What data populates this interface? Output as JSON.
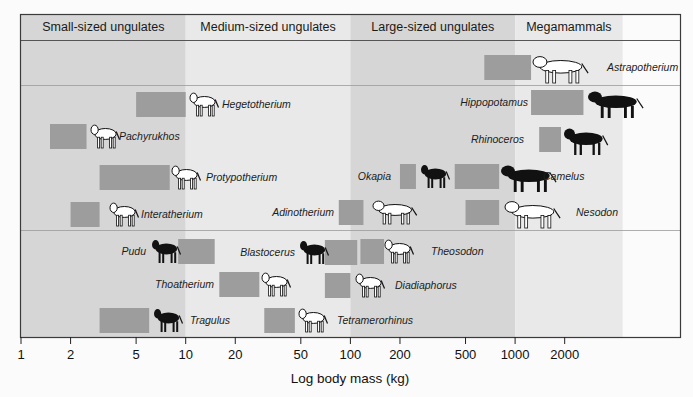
{
  "chart_data": {
    "type": "range",
    "title": "",
    "xlabel": "Log body mass (kg)",
    "ylabel": "",
    "x_scale": "log10",
    "xlim": [
      1,
      4500
    ],
    "x_ticks": [
      1,
      2,
      5,
      10,
      20,
      50,
      100,
      200,
      500,
      1000,
      2000
    ],
    "x_tick_labels": [
      "1",
      "2",
      "5",
      "10",
      "20",
      "50",
      "100",
      "200",
      "500",
      "1000",
      "2000"
    ],
    "grid": false,
    "legend": null,
    "size_classes": [
      {
        "name": "Small-sized ungulates",
        "range_kg": [
          1,
          10
        ],
        "shade": "#d6d6d6"
      },
      {
        "name": "Medium-sized ungulates",
        "range_kg": [
          10,
          100
        ],
        "shade": "#e9e9e9"
      },
      {
        "name": "Large-sized ungulates",
        "range_kg": [
          100,
          1000
        ],
        "shade": "#d6d6d6"
      },
      {
        "name": "Megamammals",
        "range_kg": [
          1000,
          4500
        ],
        "shade": "#e9e9e9"
      }
    ],
    "row_groups": [
      {
        "name": "megamammal-row",
        "y_top": 40,
        "y_bottom": 85
      },
      {
        "name": "native-and-extant-row",
        "y_top": 85,
        "y_bottom": 230
      },
      {
        "name": "ungulate-comparison-row",
        "y_top": 230,
        "y_bottom": 337
      }
    ],
    "taxa": [
      {
        "name": "Astrapotherium",
        "min_kg": 650,
        "max_kg": 1250,
        "y": 55,
        "silhouette": "outline",
        "label_side": "right",
        "icon_x": 533,
        "label_x": 607
      },
      {
        "name": "Hegetotherium",
        "min_kg": 5,
        "max_kg": 10,
        "y": 92,
        "silhouette": "outline",
        "label_side": "right",
        "icon_x": 190,
        "label_x": 222
      },
      {
        "name": "Hippopotamus",
        "min_kg": 1250,
        "max_kg": 2600,
        "y": 90,
        "silhouette": "filled",
        "label_side": "left",
        "icon_x": 588,
        "label_x": 528
      },
      {
        "name": "Pachyrukhos",
        "min_kg": 1.5,
        "max_kg": 2.5,
        "y": 124,
        "silhouette": "outline",
        "label_side": "right",
        "icon_x": 91,
        "label_x": 119
      },
      {
        "name": "Rhinoceros",
        "min_kg": 1400,
        "max_kg": 1900,
        "y": 127,
        "silhouette": "filled",
        "label_side": "left",
        "icon_x": 564,
        "label_x": 524
      },
      {
        "name": "Okapia",
        "min_kg": 200,
        "max_kg": 250,
        "y": 164,
        "silhouette": "filled",
        "label_side": "left",
        "icon_x": 421,
        "label_x": 391
      },
      {
        "name": "Camelus",
        "min_kg": 430,
        "max_kg": 800,
        "y": 164,
        "silhouette": "filled",
        "label_side": "right",
        "icon_x": 501,
        "label_x": 543
      },
      {
        "name": "Protypotherium",
        "min_kg": 3,
        "max_kg": 8,
        "y": 165,
        "silhouette": "outline",
        "label_side": "right",
        "icon_x": 172,
        "label_x": 206
      },
      {
        "name": "Interatherium",
        "min_kg": 2,
        "max_kg": 3,
        "y": 202,
        "silhouette": "outline",
        "label_side": "right",
        "icon_x": 110,
        "label_x": 141
      },
      {
        "name": "Adinotherium",
        "min_kg": 85,
        "max_kg": 120,
        "y": 200,
        "silhouette": "outline",
        "label_side": "left",
        "icon_x": 373,
        "label_x": 334
      },
      {
        "name": "Nesodon",
        "min_kg": 500,
        "max_kg": 800,
        "y": 200,
        "silhouette": "outline",
        "label_side": "right",
        "icon_x": 505,
        "label_x": 576
      },
      {
        "name": "Pudu",
        "min_kg": 9,
        "max_kg": 15,
        "y": 239,
        "silhouette": "filled",
        "label_side": "left",
        "icon_x": 152,
        "label_x": 146
      },
      {
        "name": "Blastocerus",
        "min_kg": 70,
        "max_kg": 110,
        "y": 240,
        "silhouette": "filled",
        "label_side": "left",
        "icon_x": 300,
        "label_x": 295
      },
      {
        "name": "Theosodon",
        "min_kg": 115,
        "max_kg": 160,
        "y": 239,
        "silhouette": "outline",
        "label_side": "right",
        "icon_x": 385,
        "label_x": 431
      },
      {
        "name": "Thoatherium",
        "min_kg": 16,
        "max_kg": 28,
        "y": 272,
        "silhouette": "outline",
        "label_side": "left",
        "icon_x": 262,
        "label_x": 214
      },
      {
        "name": "Diadiaphorus",
        "min_kg": 70,
        "max_kg": 100,
        "y": 273,
        "silhouette": "outline",
        "label_side": "right",
        "icon_x": 356,
        "label_x": 395
      },
      {
        "name": "Tragulus",
        "min_kg": 3,
        "max_kg": 6,
        "y": 308,
        "silhouette": "filled",
        "label_side": "right",
        "icon_x": 154,
        "label_x": 190
      },
      {
        "name": "Tetramerorhinus",
        "min_kg": 30,
        "max_kg": 46,
        "y": 308,
        "silhouette": "outline",
        "label_side": "right",
        "icon_x": 299,
        "label_x": 337
      }
    ],
    "colors": {
      "range_box": "#9d9d9d",
      "frame": "#3a3a3a",
      "divider": "#9a9a9a",
      "filled_silhouette": "#111111",
      "outline_silhouette_fill": "#ffffff"
    }
  }
}
